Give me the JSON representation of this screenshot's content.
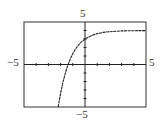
{
  "chart_data": {
    "type": "line",
    "title": "",
    "xlabel": "",
    "ylabel": "",
    "xlim": [
      -5,
      5
    ],
    "ylim": [
      -5,
      5
    ],
    "grid": false,
    "tick_step": 1,
    "labels": {
      "ymax": "5",
      "ymin": "−5",
      "xmin": "−5",
      "xmax": "5"
    },
    "series": [
      {
        "name": "y = 4 − e^(−x)",
        "x": [
          -2.2,
          -2.0,
          -1.8,
          -1.6,
          -1.4,
          -1.2,
          -1.0,
          -0.8,
          -0.6,
          -0.4,
          -0.2,
          0,
          0.5,
          1,
          1.5,
          2,
          3,
          4,
          5
        ],
        "y": [
          -5.0,
          -3.39,
          -2.05,
          -0.95,
          -0.06,
          0.68,
          1.28,
          1.77,
          2.18,
          2.51,
          2.78,
          3.0,
          3.39,
          3.63,
          3.78,
          3.86,
          3.95,
          3.98,
          3.99
        ]
      }
    ],
    "colors": {
      "curve": "#222222",
      "axes": "#222222",
      "frame": "#333333"
    }
  }
}
